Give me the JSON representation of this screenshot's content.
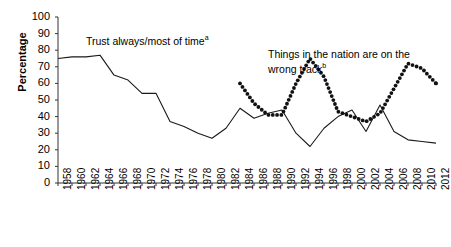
{
  "chart_data": {
    "type": "line",
    "title": "",
    "subtitle": "",
    "xlabel": "",
    "ylabel": "Percentage",
    "ylim": [
      0,
      100
    ],
    "ytick_values": [
      0,
      10,
      20,
      30,
      40,
      50,
      60,
      70,
      80,
      90,
      100
    ],
    "xlim": [
      1958,
      2012
    ],
    "grid": false,
    "legend_position": "inline-annotations",
    "categories": [
      1958,
      1960,
      1962,
      1964,
      1966,
      1968,
      1970,
      1972,
      1974,
      1976,
      1978,
      1980,
      1982,
      1984,
      1986,
      1988,
      1990,
      1992,
      1994,
      1996,
      1998,
      2000,
      2002,
      2004,
      2006,
      2008,
      2010,
      2012
    ],
    "series": [
      {
        "name": "Trust always/most of time",
        "annotation": "Trust always/most of time",
        "annotation_superscript": "a",
        "style": "solid",
        "color": "#1a1a1a",
        "x": [
          1958,
          1960,
          1962,
          1964,
          1966,
          1968,
          1970,
          1972,
          1974,
          1976,
          1978,
          1980,
          1982,
          1984,
          1986,
          1988,
          1990,
          1992,
          1994,
          1996,
          1998,
          2000,
          2002,
          2004,
          2006,
          2008,
          2010,
          2012
        ],
        "values": [
          75,
          76,
          76,
          77,
          65,
          62,
          54,
          54,
          37,
          34,
          30,
          27,
          33,
          45,
          39,
          42,
          44,
          30,
          22,
          33,
          40,
          44,
          31,
          47,
          31,
          26,
          25,
          24
        ]
      },
      {
        "name": "Things in the nation are on the wrong track",
        "annotation": "Things in the nation are on the wrong track",
        "annotation_superscript": "b",
        "style": "dotted",
        "color": "#111111",
        "x": [
          1984,
          1986,
          1988,
          1990,
          1992,
          1994,
          1996,
          1998,
          2000,
          2002,
          2004,
          2006,
          2008,
          2010,
          2012
        ],
        "values": [
          60,
          48,
          41,
          41,
          60,
          75,
          64,
          43,
          40,
          37,
          42,
          57,
          72,
          69,
          60
        ]
      }
    ],
    "annotations": [
      {
        "text": "Trust always/most of time",
        "superscript": "a"
      },
      {
        "text": "Things in the nation are on the wrong track",
        "superscript": "b"
      }
    ]
  },
  "axis": {
    "y_label": "Percentage",
    "y_ticks": [
      "100",
      "90",
      "80",
      "70",
      "60",
      "50",
      "40",
      "30",
      "20",
      "10",
      "0"
    ],
    "x_ticks": [
      "1958",
      "1960",
      "1962",
      "1964",
      "1966",
      "1968",
      "1970",
      "1972",
      "1974",
      "1976",
      "1978",
      "1980",
      "1982",
      "1984",
      "1986",
      "1988",
      "1990",
      "1992",
      "1994",
      "1996",
      "1998",
      "2000",
      "2002",
      "2004",
      "2006",
      "2008",
      "2010",
      "2012"
    ]
  },
  "annotations": {
    "trust_label": "Trust always/most of time",
    "trust_superscript": "a",
    "wrongtrack_label_line1": "Things in the nation are on the",
    "wrongtrack_label_line2": "wrong track",
    "wrongtrack_superscript": "b"
  },
  "colors": {
    "line": "#1a1a1a",
    "dots": "#111111",
    "axis": "#333333",
    "text": "#000000",
    "background": "#ffffff"
  }
}
